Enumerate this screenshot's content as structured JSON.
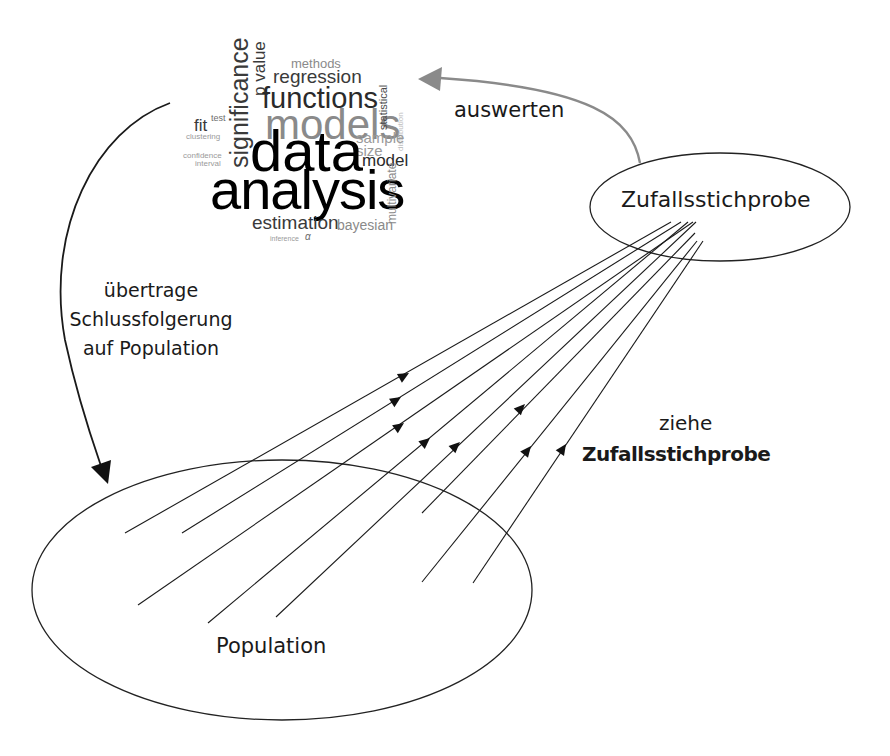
{
  "diagram": {
    "labels": {
      "sample_node": "Zufallsstichprobe",
      "population_node": "Population",
      "evaluate_arrow": "auswerten",
      "infer_line1": "übertrage",
      "infer_line2": "Schlussfolgerung",
      "infer_line3": "auf Population",
      "draw_line1": "ziehe",
      "draw_line2": "Zufallsstichprobe"
    },
    "word_cloud": {
      "significance": "significance",
      "p_value": "p value",
      "methods": "methods",
      "regression": "regression",
      "functions": "functions",
      "fit": "fit",
      "test": "test",
      "clustering": "clustering",
      "confidence": "confidence",
      "interval": "interval",
      "models": "models",
      "statistical": "statistical",
      "distribution": "distribution",
      "sample": "sample",
      "size": "size",
      "model": "model",
      "data": "data",
      "analysis": "analysis",
      "multivariate": "multivariate",
      "estimation": "estimation",
      "bayesian": "bayesian",
      "inference": "inference",
      "alpha": "α"
    },
    "colors": {
      "line": "#1a1a1a",
      "evaluate_arrow": "#8a8a8a",
      "wc_black": "#000000",
      "wc_dark": "#3a3a3a",
      "wc_mid": "#6e6e6e",
      "wc_light": "#9a9a9a",
      "wc_faint": "#bdbdbd"
    },
    "sampling_lines": [
      {
        "from": [
          125,
          533
        ],
        "to": [
          671,
          222
        ],
        "arrow": [
          405,
          375
        ]
      },
      {
        "from": [
          182,
          533
        ],
        "to": [
          681,
          222
        ],
        "arrow": [
          397,
          400
        ]
      },
      {
        "from": [
          138,
          605
        ],
        "to": [
          693,
          222
        ],
        "arrow": [
          400,
          426
        ]
      },
      {
        "from": [
          208,
          623
        ],
        "to": [
          688,
          222
        ],
        "arrow": [
          426,
          442
        ]
      },
      {
        "from": [
          276,
          617
        ],
        "to": [
          696,
          222
        ],
        "arrow": [
          457,
          446
        ]
      },
      {
        "from": [
          422,
          513
        ],
        "to": [
          695,
          233
        ],
        "arrow": [
          522,
          408
        ]
      },
      {
        "from": [
          422,
          582
        ],
        "to": [
          697,
          241
        ],
        "arrow": [
          528,
          450
        ]
      },
      {
        "from": [
          473,
          583
        ],
        "to": [
          703,
          241
        ],
        "arrow": [
          563,
          448
        ]
      }
    ]
  }
}
